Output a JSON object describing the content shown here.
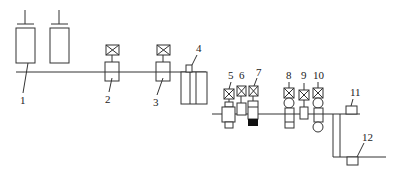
{
  "diagram": {
    "type": "process-flow-schematic",
    "labels": {
      "l1": "1",
      "l2": "2",
      "l3": "3",
      "l4": "4",
      "l5": "5",
      "l6": "6",
      "l7": "7",
      "l8": "8",
      "l9": "9",
      "l10": "10",
      "l11": "11",
      "l12": "12"
    },
    "components": [
      {
        "id": "1",
        "kind": "tank"
      },
      {
        "id": "2",
        "kind": "valve-with-actuator"
      },
      {
        "id": "3",
        "kind": "valve-with-actuator"
      },
      {
        "id": "4",
        "kind": "multi-chamber-unit"
      },
      {
        "id": "5",
        "kind": "valve-with-actuator"
      },
      {
        "id": "6",
        "kind": "valve-with-actuator"
      },
      {
        "id": "7",
        "kind": "valve-with-actuator"
      },
      {
        "id": "8",
        "kind": "roller-valve"
      },
      {
        "id": "9",
        "kind": "valve-with-actuator"
      },
      {
        "id": "10",
        "kind": "roller-valve"
      },
      {
        "id": "11",
        "kind": "sensor-block"
      },
      {
        "id": "12",
        "kind": "sensor-block"
      }
    ]
  }
}
